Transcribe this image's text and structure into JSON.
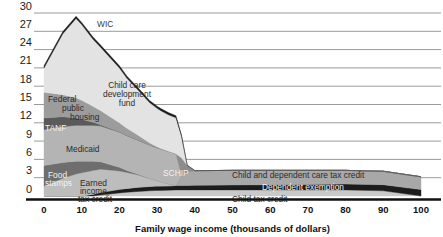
{
  "chart_data": {
    "type": "area",
    "title": "",
    "xlabel": "Family wage income (thousands of dollars)",
    "ylabel": "",
    "xlim": [
      0,
      100
    ],
    "ylim": [
      0,
      30
    ],
    "xticks": [
      0,
      10,
      20,
      30,
      40,
      50,
      60,
      70,
      80,
      90,
      100
    ],
    "yticks": [
      0,
      3,
      6,
      9,
      12,
      15,
      18,
      21,
      24,
      27,
      30
    ],
    "grid": "horizontal",
    "legend": "inline-annotations",
    "stacked": true,
    "x": [
      0,
      5,
      8.5,
      10,
      13,
      15,
      20,
      22,
      25,
      28,
      29.5,
      30,
      31,
      33,
      35,
      36.5,
      38,
      40,
      50,
      60,
      70,
      80,
      90,
      100
    ],
    "series": [
      {
        "name": "Child tax credit",
        "color": "#c9c9c9",
        "values": [
          0,
          0,
          0,
          0,
          0,
          0.15,
          0.5,
          0.6,
          0.75,
          0.85,
          0.9,
          0.9,
          0.92,
          0.95,
          1.0,
          1.0,
          1.0,
          1.0,
          1.0,
          1.0,
          1.0,
          1.0,
          0.85,
          0.0
        ]
      },
      {
        "name": "Dependent exemption",
        "color": "#1c1c1c",
        "values": [
          0,
          0,
          0,
          0,
          0.3,
          0.45,
          0.6,
          0.65,
          0.7,
          0.72,
          0.72,
          0.72,
          0.72,
          0.72,
          0.72,
          0.72,
          0.72,
          0.75,
          0.8,
          0.85,
          0.9,
          0.95,
          1.0,
          1.05
        ]
      },
      {
        "name": "Child and dependent care tax credit",
        "color": "#a8a8a8",
        "values": [
          0,
          0,
          0,
          0,
          0,
          0,
          0,
          0,
          0,
          0,
          0,
          0,
          0,
          0,
          0,
          1.5,
          2.3,
          2.4,
          2.4,
          2.35,
          2.3,
          2.25,
          2.2,
          2.1
        ]
      },
      {
        "name": "Earned income tax credit",
        "color": "#bdbdbd",
        "values": [
          1.6,
          2.9,
          3.6,
          3.8,
          3.9,
          3.8,
          3.0,
          2.6,
          2.0,
          1.3,
          1.0,
          0.9,
          0.7,
          0.35,
          0.0,
          0,
          0,
          0,
          0,
          0,
          0,
          0,
          0,
          0
        ]
      },
      {
        "name": "Food stamps",
        "color": "#6e6e6e",
        "values": [
          3.4,
          2.6,
          2.1,
          1.9,
          1.5,
          1.2,
          0.6,
          0.35,
          0.1,
          0,
          0,
          0,
          0,
          0,
          0,
          0,
          0,
          0,
          0,
          0,
          0,
          0,
          0,
          0
        ]
      },
      {
        "name": "Medicaid",
        "color": "#b4b4b4",
        "values": [
          5.9,
          5.9,
          5.9,
          5.9,
          5.9,
          5.9,
          5.8,
          5.7,
          5.6,
          5.5,
          5.4,
          5.4,
          5.4,
          5.3,
          5.2,
          0,
          0,
          0,
          0,
          0,
          0,
          0,
          0,
          0
        ]
      },
      {
        "name": "SCHIP",
        "color": "#8c8c8c",
        "values": [
          0,
          0,
          0,
          0,
          0,
          0,
          0,
          0,
          0,
          0,
          0,
          0,
          0,
          0,
          0,
          3.0,
          1.0,
          0,
          0,
          0,
          0,
          0,
          0,
          0
        ]
      },
      {
        "name": "TANF",
        "color": "#5a5a5a",
        "values": [
          1.9,
          1.6,
          1.2,
          1.0,
          0.5,
          0.2,
          0,
          0,
          0,
          0,
          0,
          0,
          0,
          0,
          0,
          0,
          0,
          0,
          0,
          0,
          0,
          0,
          0,
          0
        ]
      },
      {
        "name": "Federal public housing",
        "color": "#9c9c9c",
        "values": [
          4.2,
          3.6,
          3.3,
          3.1,
          2.6,
          2.3,
          1.5,
          1.2,
          0.8,
          0.35,
          0.2,
          0.15,
          0.05,
          0,
          0,
          0,
          0,
          0,
          0,
          0,
          0,
          0,
          0,
          0
        ]
      },
      {
        "name": "Child care development fund",
        "color": "#e3e3e3",
        "values": [
          4.0,
          10.0,
          13.0,
          12.4,
          11.0,
          10.4,
          9.0,
          8.2,
          7.4,
          6.6,
          6.4,
          6.3,
          6.2,
          6.0,
          5.9,
          3.5,
          0,
          0,
          0,
          0,
          0,
          0,
          0,
          0
        ]
      },
      {
        "name": "WIC",
        "color": "#1c1c1c",
        "values": [
          0.35,
          0.35,
          0.35,
          0.35,
          0.35,
          0.35,
          0.35,
          0.35,
          0.35,
          0.35,
          0.35,
          0.35,
          0.35,
          0.35,
          0.35,
          0.2,
          0,
          0,
          0,
          0,
          0,
          0,
          0,
          0
        ]
      }
    ],
    "annotations": [
      {
        "name": "WIC",
        "text": "WIC",
        "x": 97,
        "y": 27,
        "align": "start",
        "style": "dark"
      },
      {
        "name": "Child care development fund",
        "text": "Child care",
        "x": 127,
        "y": 88,
        "align": "middle",
        "style": "dark"
      },
      {
        "name": "Child care development fund",
        "text": "development",
        "x": 127,
        "y": 97,
        "align": "middle",
        "style": "dark"
      },
      {
        "name": "Child care development fund",
        "text": "fund",
        "x": 127,
        "y": 106,
        "align": "middle",
        "style": "dark"
      },
      {
        "name": "Federal public housing",
        "text": "Federal",
        "x": 48,
        "y": 102,
        "align": "start",
        "style": "dark"
      },
      {
        "name": "Federal public housing",
        "text": "public",
        "x": 62,
        "y": 111,
        "align": "start",
        "style": "dark"
      },
      {
        "name": "Federal public housing",
        "text": "housing",
        "x": 70,
        "y": 120,
        "align": "start",
        "style": "dark"
      },
      {
        "name": "TANF",
        "text": "TANF",
        "x": 45,
        "y": 131,
        "align": "start",
        "style": "light"
      },
      {
        "name": "Medicaid",
        "text": "Medicaid",
        "x": 66,
        "y": 152,
        "align": "start",
        "style": "dark"
      },
      {
        "name": "Food stamps",
        "text": "Food",
        "x": 48,
        "y": 178,
        "align": "start",
        "style": "light"
      },
      {
        "name": "Food stamps",
        "text": "stamps",
        "x": 45,
        "y": 186,
        "align": "start",
        "style": "light"
      },
      {
        "name": "Earned income tax credit",
        "text": "Earned",
        "x": 80,
        "y": 186,
        "align": "start",
        "style": "dark"
      },
      {
        "name": "Earned income tax credit",
        "text": "income",
        "x": 80,
        "y": 194,
        "align": "start",
        "style": "dark"
      },
      {
        "name": "Earned income tax credit",
        "text": "tax credit",
        "x": 78,
        "y": 202,
        "align": "start",
        "style": "dark"
      },
      {
        "name": "SCHIP",
        "text": "SCHIP",
        "x": 163,
        "y": 176,
        "align": "start",
        "style": "light"
      },
      {
        "name": "Child and dependent care tax credit",
        "text": "Child and dependent care tax credit",
        "x": 232,
        "y": 178,
        "align": "start",
        "style": "dark"
      },
      {
        "name": "Dependent exemption",
        "text": "Dependent exemption",
        "x": 262,
        "y": 190,
        "align": "start",
        "style": "light"
      },
      {
        "name": "Child tax credit",
        "text": "Child tax credit",
        "x": 232,
        "y": 202,
        "align": "start",
        "style": "dark"
      }
    ]
  },
  "colors": {
    "gridline": "#9a9a9a",
    "axis": "#111111",
    "background": "#ffffff"
  }
}
